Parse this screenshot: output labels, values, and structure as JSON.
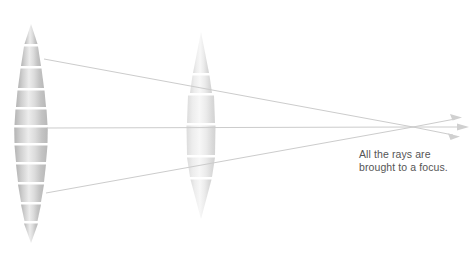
{
  "diagram": {
    "background_color": "#ffffff",
    "caption": {
      "line1": "All the rays are",
      "line2": "brought to a focus.",
      "color": "#555555",
      "x": 359,
      "y": 148
    },
    "lenses": [
      {
        "name": "left-lens",
        "shape": "biconvex-segmented",
        "center_x": 31,
        "top_y": 24,
        "bottom_y": 243,
        "max_half_width": 17,
        "segment_count": 11,
        "fill_light": "#f2f2f2",
        "fill_dark": "#a9a9a9",
        "gap_color": "#ffffff"
      },
      {
        "name": "right-lens",
        "shape": "biconvex-segmented",
        "center_x": 201,
        "top_y": 32,
        "bottom_y": 219,
        "max_half_width": 15,
        "segment_count": 5,
        "fill_light": "#f6f6f6",
        "fill_dark": "#c9c9c9",
        "gap_color": "#ffffff"
      }
    ],
    "rays": {
      "color": "#cfcfcf",
      "stroke_width": 1,
      "incoming": [
        {
          "name": "ray-top",
          "x1": 74,
          "y1": 62,
          "x2": 196,
          "y2": 62
        },
        {
          "name": "ray-middle",
          "x1": 80,
          "y1": 128,
          "x2": 196,
          "y2": 128
        },
        {
          "name": "ray-bottom",
          "x1": 78,
          "y1": 188,
          "x2": 196,
          "y2": 188
        }
      ],
      "converging": [
        {
          "name": "converging-ray-top",
          "x1": 44,
          "y1": 59,
          "x2": 413,
          "y2": 127
        },
        {
          "name": "converging-ray-middle",
          "x1": 47,
          "y1": 128,
          "x2": 413,
          "y2": 127
        },
        {
          "name": "converging-ray-bottom",
          "x1": 46,
          "y1": 193,
          "x2": 413,
          "y2": 127
        }
      ],
      "diverging": [
        {
          "name": "exit-ray-upper",
          "x1": 413,
          "y1": 127,
          "x2": 462,
          "y2": 118
        },
        {
          "name": "exit-ray-straight",
          "x1": 413,
          "y1": 127,
          "x2": 468,
          "y2": 127
        },
        {
          "name": "exit-ray-lower",
          "x1": 413,
          "y1": 127,
          "x2": 460,
          "y2": 136
        }
      ],
      "focus_point": {
        "x": 413,
        "y": 127
      },
      "arrow_count": 3
    }
  }
}
